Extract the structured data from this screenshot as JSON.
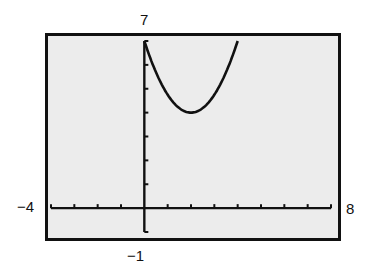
{
  "chart_data": {
    "type": "line",
    "title": "",
    "xlabel": "",
    "ylabel": "",
    "window": {
      "xmin": -4,
      "xmax": 8,
      "ymin": -1,
      "ymax": 7,
      "xscl": 1,
      "yscl": 1
    },
    "xlim": [
      -4,
      8
    ],
    "ylim": [
      -1,
      7
    ],
    "grid": false,
    "legend": null,
    "series": [
      {
        "name": "y1",
        "description": "parabola opening upward, vertex near (2, 4), drawn from x=0",
        "x": [
          0,
          0.5,
          1,
          1.5,
          2,
          2.5,
          3,
          3.5,
          4
        ],
        "values": [
          7,
          5.7,
          4.75,
          4.2,
          4,
          4.2,
          4.75,
          5.7,
          7
        ]
      }
    ],
    "tick_labels": {
      "ymax": "7",
      "ymin": "−1",
      "xmin": "−4",
      "xmax": "8"
    }
  },
  "labels": {
    "ymax": "7",
    "ymin": "−1",
    "xmin": "−4",
    "xmax": "8"
  },
  "colors": {
    "screen_bg": "#ececec",
    "ink": "#111111",
    "page_bg": "#ffffff"
  }
}
